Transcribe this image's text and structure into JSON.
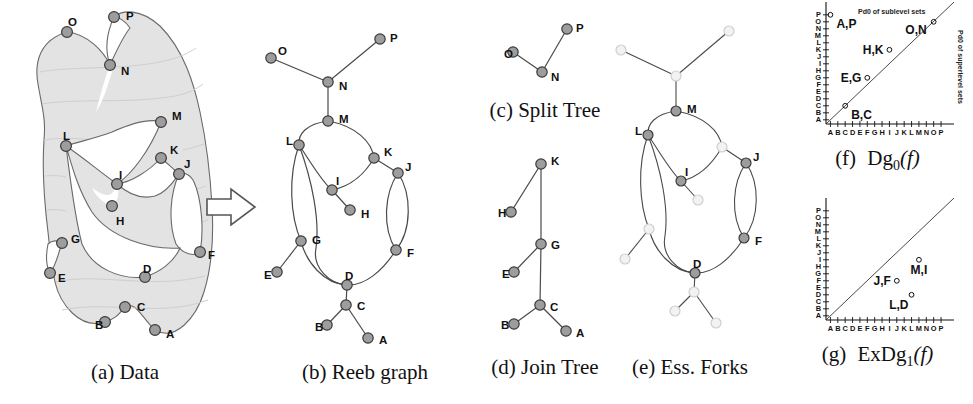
{
  "figure": {
    "node_fill": "#9d9d9d",
    "node_stroke": "#3a3a3a",
    "faded_fill": "#f2f2f2",
    "faded_stroke": "#cfcfcf",
    "surface_fill": "#e3e3e3",
    "edge_color": "#4a4a4a"
  },
  "panels": {
    "a": {
      "key": "a",
      "caption_prefix": "(a)",
      "caption_text": "Data",
      "nodes": [
        {
          "id": "P",
          "label": "P",
          "x": 114,
          "y": 17,
          "lx": 126,
          "ly": 16
        },
        {
          "id": "O",
          "label": "O",
          "x": 67,
          "y": 32,
          "lx": 68,
          "ly": 22
        },
        {
          "id": "N",
          "label": "N",
          "x": 110,
          "y": 65,
          "lx": 121,
          "ly": 71
        },
        {
          "id": "M",
          "label": "M",
          "x": 161,
          "y": 122,
          "lx": 172,
          "ly": 116
        },
        {
          "id": "L",
          "label": "L",
          "x": 66,
          "y": 146,
          "lx": 63,
          "ly": 136
        },
        {
          "id": "K",
          "label": "K",
          "x": 161,
          "y": 158,
          "lx": 170,
          "ly": 150
        },
        {
          "id": "J",
          "label": "J",
          "x": 179,
          "y": 174,
          "lx": 184,
          "ly": 164
        },
        {
          "id": "I",
          "label": "I",
          "x": 117,
          "y": 184,
          "lx": 119,
          "ly": 175
        },
        {
          "id": "H",
          "label": "H",
          "x": 112,
          "y": 206,
          "lx": 116,
          "ly": 221
        },
        {
          "id": "G",
          "label": "G",
          "x": 62,
          "y": 243,
          "lx": 71,
          "ly": 239
        },
        {
          "id": "F",
          "label": "F",
          "x": 200,
          "y": 252,
          "lx": 208,
          "ly": 255
        },
        {
          "id": "E",
          "label": "E",
          "x": 50,
          "y": 273,
          "lx": 58,
          "ly": 278
        },
        {
          "id": "D",
          "label": "D",
          "x": 145,
          "y": 277,
          "lx": 143,
          "ly": 269
        },
        {
          "id": "C",
          "label": "C",
          "x": 125,
          "y": 307,
          "lx": 137,
          "ly": 307
        },
        {
          "id": "B",
          "label": "B",
          "x": 105,
          "y": 322,
          "lx": 95,
          "ly": 325
        },
        {
          "id": "A",
          "label": "A",
          "x": 155,
          "y": 330,
          "lx": 166,
          "ly": 334
        }
      ]
    },
    "arrow": {
      "label": "transform-arrow"
    },
    "b": {
      "key": "b",
      "caption_prefix": "(b)",
      "caption_text": "Reeb graph",
      "nodes": [
        {
          "id": "P",
          "label": "P",
          "x": 380,
          "y": 39,
          "lx": 390,
          "ly": 38
        },
        {
          "id": "O",
          "label": "O",
          "x": 271,
          "y": 58,
          "lx": 278,
          "ly": 51
        },
        {
          "id": "N",
          "label": "N",
          "x": 328,
          "y": 82,
          "lx": 339,
          "ly": 86
        },
        {
          "id": "M",
          "label": "M",
          "x": 328,
          "y": 121,
          "lx": 339,
          "ly": 119
        },
        {
          "id": "L",
          "label": "L",
          "x": 299,
          "y": 145,
          "lx": 286,
          "ly": 141
        },
        {
          "id": "K",
          "label": "K",
          "x": 374,
          "y": 158,
          "lx": 384,
          "ly": 152
        },
        {
          "id": "J",
          "label": "J",
          "x": 398,
          "y": 173,
          "lx": 405,
          "ly": 167
        },
        {
          "id": "I",
          "label": "I",
          "x": 332,
          "y": 190,
          "lx": 336,
          "ly": 181
        },
        {
          "id": "H",
          "label": "H",
          "x": 350,
          "y": 210,
          "lx": 361,
          "ly": 214
        },
        {
          "id": "G",
          "label": "G",
          "x": 301,
          "y": 241,
          "lx": 312,
          "ly": 240
        },
        {
          "id": "F",
          "label": "F",
          "x": 396,
          "y": 250,
          "lx": 407,
          "ly": 253
        },
        {
          "id": "E",
          "label": "E",
          "x": 277,
          "y": 272,
          "lx": 264,
          "ly": 275
        },
        {
          "id": "D",
          "label": "D",
          "x": 347,
          "y": 285,
          "lx": 345,
          "ly": 276
        },
        {
          "id": "C",
          "label": "C",
          "x": 346,
          "y": 305,
          "lx": 357,
          "ly": 306
        },
        {
          "id": "B",
          "label": "B",
          "x": 327,
          "y": 325,
          "lx": 315,
          "ly": 327
        },
        {
          "id": "A",
          "label": "A",
          "x": 368,
          "y": 338,
          "lx": 379,
          "ly": 340
        }
      ]
    },
    "c": {
      "key": "c",
      "caption_prefix": "(c)",
      "caption_text": "Split Tree",
      "nodes": [
        {
          "id": "P",
          "label": "P",
          "x": 567,
          "y": 29,
          "lx": 576,
          "ly": 28
        },
        {
          "id": "O",
          "label": "O",
          "x": 513,
          "y": 52,
          "lx": 504,
          "ly": 54
        },
        {
          "id": "N",
          "label": "N",
          "x": 542,
          "y": 72,
          "lx": 551,
          "ly": 77
        }
      ]
    },
    "d": {
      "key": "d",
      "caption_prefix": "(d)",
      "caption_text": "Join Tree",
      "nodes": [
        {
          "id": "K",
          "label": "K",
          "x": 541,
          "y": 164,
          "lx": 551,
          "ly": 161
        },
        {
          "id": "H",
          "label": "H",
          "x": 511,
          "y": 212,
          "lx": 498,
          "ly": 213
        },
        {
          "id": "G",
          "label": "G",
          "x": 541,
          "y": 244,
          "lx": 551,
          "ly": 245
        },
        {
          "id": "E",
          "label": "E",
          "x": 514,
          "y": 272,
          "lx": 502,
          "ly": 274
        },
        {
          "id": "C",
          "label": "C",
          "x": 540,
          "y": 305,
          "lx": 550,
          "ly": 307
        },
        {
          "id": "B",
          "label": "B",
          "x": 514,
          "y": 324,
          "lx": 501,
          "ly": 325
        },
        {
          "id": "A",
          "label": "A",
          "x": 566,
          "y": 331,
          "lx": 576,
          "ly": 333
        }
      ]
    },
    "e": {
      "key": "e",
      "caption_prefix": "(e)",
      "caption_text": "Ess. Forks",
      "essential_labels": [
        "M",
        "L",
        "I",
        "J",
        "F",
        "D"
      ],
      "nodes": [
        {
          "id": "P",
          "label": "",
          "x": 729,
          "y": 31,
          "essential": false,
          "lx": 0,
          "ly": 0
        },
        {
          "id": "O",
          "label": "",
          "x": 621,
          "y": 50,
          "essential": false,
          "lx": 0,
          "ly": 0
        },
        {
          "id": "N",
          "label": "",
          "x": 676,
          "y": 76,
          "essential": false,
          "lx": 0,
          "ly": 0
        },
        {
          "id": "M",
          "label": "M",
          "x": 676,
          "y": 111,
          "essential": true,
          "lx": 687,
          "ly": 109
        },
        {
          "id": "L",
          "label": "L",
          "x": 648,
          "y": 135,
          "essential": true,
          "lx": 635,
          "ly": 131
        },
        {
          "id": "K",
          "label": "",
          "x": 722,
          "y": 147,
          "essential": false,
          "lx": 0,
          "ly": 0
        },
        {
          "id": "J",
          "label": "J",
          "x": 746,
          "y": 163,
          "essential": true,
          "lx": 753,
          "ly": 157
        },
        {
          "id": "I",
          "label": "I",
          "x": 681,
          "y": 181,
          "essential": true,
          "lx": 685,
          "ly": 172
        },
        {
          "id": "H",
          "label": "",
          "x": 698,
          "y": 200,
          "essential": false,
          "lx": 0,
          "ly": 0
        },
        {
          "id": "G",
          "label": "",
          "x": 649,
          "y": 229,
          "essential": false,
          "lx": 0,
          "ly": 0
        },
        {
          "id": "F",
          "label": "F",
          "x": 744,
          "y": 238,
          "essential": true,
          "lx": 755,
          "ly": 241
        },
        {
          "id": "E",
          "label": "",
          "x": 625,
          "y": 259,
          "essential": false,
          "lx": 0,
          "ly": 0
        },
        {
          "id": "D",
          "label": "D",
          "x": 695,
          "y": 273,
          "essential": true,
          "lx": 693,
          "ly": 264
        },
        {
          "id": "C",
          "label": "",
          "x": 694,
          "y": 292,
          "essential": false,
          "lx": 0,
          "ly": 0
        },
        {
          "id": "B",
          "label": "",
          "x": 675,
          "y": 311,
          "essential": false,
          "lx": 0,
          "ly": 0
        },
        {
          "id": "A",
          "label": "",
          "x": 716,
          "y": 323,
          "essential": false,
          "lx": 0,
          "ly": 0
        }
      ]
    }
  },
  "chart_data": [
    {
      "id": "f",
      "type": "scatter",
      "title": "Dg0(f)",
      "caption_prefix": "(f)",
      "caption_main": "Dg",
      "caption_sub": "0",
      "caption_arg": "(f)",
      "xlabel": "",
      "ylabel": "",
      "tick_labels": [
        "A",
        "B",
        "C",
        "D",
        "E",
        "F",
        "G",
        "H",
        "I",
        "J",
        "K",
        "L",
        "M",
        "N",
        "O",
        "P"
      ],
      "xticks": [
        "A",
        "B",
        "C",
        "D",
        "E",
        "F",
        "G",
        "H",
        "I",
        "J",
        "K",
        "L",
        "M",
        "N",
        "O",
        "P"
      ],
      "yticks": [
        "A",
        "B",
        "C",
        "D",
        "E",
        "F",
        "G",
        "H",
        "I",
        "J",
        "K",
        "L",
        "M",
        "N",
        "O",
        "P"
      ],
      "xlim": [
        "A",
        "P"
      ],
      "ylim": [
        "A",
        "P"
      ],
      "grid": false,
      "diagonal": true,
      "annotations": [
        {
          "text": "Pd0 of sublevel sets",
          "position": "above-diagonal",
          "rotation": 0
        },
        {
          "text": "Pd0 of superlevel sets",
          "position": "right-edge",
          "rotation": 90
        }
      ],
      "points": [
        {
          "label": "A,P",
          "x": "A",
          "y": "P",
          "label_pos": "right-below"
        },
        {
          "label": "H,K",
          "x": "I",
          "y": "K",
          "label_pos": "left"
        },
        {
          "label": "E,G",
          "x": "F",
          "y": "G",
          "label_pos": "left"
        },
        {
          "label": "B,C",
          "x": "C",
          "y": "C",
          "label_pos": "right-below"
        },
        {
          "label": "O,N",
          "x": "O",
          "y": "O",
          "label_pos": "left-below"
        }
      ]
    },
    {
      "id": "g",
      "type": "scatter",
      "title": "ExDg1(f)",
      "caption_prefix": "(g)",
      "caption_main": "ExDg",
      "caption_sub": "1",
      "caption_arg": "(f)",
      "xlabel": "",
      "ylabel": "",
      "tick_labels": [
        "A",
        "B",
        "C",
        "D",
        "E",
        "F",
        "G",
        "H",
        "I",
        "J",
        "K",
        "L",
        "M",
        "N",
        "O",
        "P"
      ],
      "xticks": [
        "A",
        "B",
        "C",
        "D",
        "E",
        "F",
        "G",
        "H",
        "I",
        "J",
        "K",
        "L",
        "M",
        "N",
        "O",
        "P"
      ],
      "yticks": [
        "A",
        "B",
        "C",
        "D",
        "E",
        "F",
        "G",
        "H",
        "I",
        "J",
        "K",
        "L",
        "M",
        "N",
        "O",
        "P"
      ],
      "xlim": [
        "A",
        "P"
      ],
      "ylim": [
        "A",
        "P"
      ],
      "grid": false,
      "diagonal": true,
      "annotations": [],
      "points": [
        {
          "label": "M,I",
          "x": "M",
          "y": "I",
          "label_pos": "below"
        },
        {
          "label": "J,F",
          "x": "J",
          "y": "F",
          "label_pos": "left"
        },
        {
          "label": "L,D",
          "x": "L",
          "y": "D",
          "label_pos": "below-left"
        }
      ]
    }
  ]
}
